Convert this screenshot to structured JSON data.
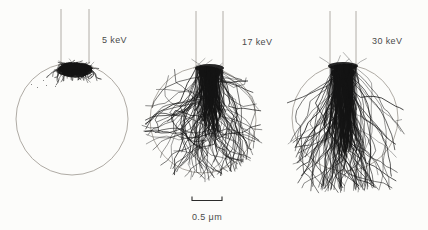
{
  "figure": {
    "kind": "electron-trajectory-simulation",
    "panels": [
      {
        "label": "5 keV",
        "energy_keV": 5
      },
      {
        "label": "17 keV",
        "energy_keV": 17
      },
      {
        "label": "30 keV",
        "energy_keV": 30
      }
    ],
    "scale_bar": {
      "label": "0.5 μm",
      "value": 0.5,
      "unit": "μm"
    },
    "colors": {
      "background": "#fcfcfa",
      "ink": "#141414",
      "outline": "#9a958e",
      "beam": "#a09a93",
      "text": "#4a4a4a",
      "scalebar": "#2b2b2b"
    }
  }
}
